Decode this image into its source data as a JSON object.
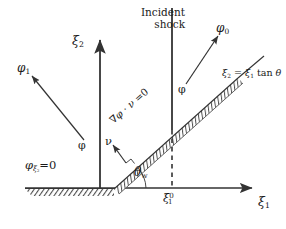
{
  "figure": {
    "background_color": "#ffffff",
    "line_color": "#333333",
    "hatch_color": "#4d4d4d",
    "width": 286,
    "height": 229
  },
  "axes": {
    "x_axis_label": "ξ1",
    "y_axis_label": "ξ2",
    "origin_x": 100,
    "origin_y": 188,
    "x_axis_end": 256,
    "y_axis_top": 42
  },
  "labels": {
    "incident_shock": "Incident shock",
    "phi_0": "φ0",
    "phi_1": "φ1",
    "phi_left": "φ",
    "phi_mid": "φ",
    "wedge_equation": "ξ2 = ξ1 tan θ",
    "wall_bc": "φξ2 = 0",
    "wedge_bc": "∇φ · ν = 0",
    "wedge_angle": "θw",
    "normal_vector": "ν",
    "shock_position": "ξ10"
  },
  "label_parts": {
    "xi": "ξ",
    "phi": "φ",
    "nu": "ν",
    "theta": "θ",
    "nabla": "∇",
    "dot": "·",
    "equals": "=",
    "zero": "0",
    "one": "1",
    "two": "2",
    "w": "w",
    "tan": "tan"
  },
  "geometry": {
    "wedge_angle_degrees": 41,
    "shock_line_x": 172,
    "wedge_apex_x": 114,
    "wedge_apex_y": 188,
    "wedge_tip_x": 238,
    "wedge_tip_y": 78,
    "dashed_line_from_y": 130,
    "dashed_line_to_y": 188,
    "wall_hatch_start_x": 25,
    "wall_hatch_end_x": 114
  }
}
